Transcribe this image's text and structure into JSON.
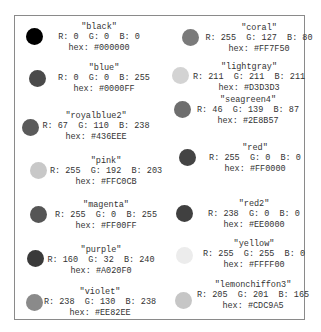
{
  "colors": [
    {
      "name": "\"black\"",
      "rgb": "R: 0  G: 0  B: 0",
      "hex": "hex: #000000",
      "swatch": "#000000",
      "display_gray": "#000000",
      "cx": 34,
      "cy": 36,
      "tx": 99,
      "ty": 22
    },
    {
      "name": "\"blue\"",
      "rgb": "R: 0  G: 0  B: 255",
      "hex": "hex: #0000FF",
      "swatch": "#0000FF",
      "display_gray": "#4a4a4a",
      "cx": 37,
      "cy": 78,
      "tx": 104,
      "ty": 63
    },
    {
      "name": "\"royalblue2\"",
      "rgb": "R: 67  G: 110  B: 238",
      "hex": "hex: #436EEE",
      "swatch": "#436EEE",
      "display_gray": "#5a5a5a",
      "cx": 30,
      "cy": 127,
      "tx": 96,
      "ty": 111
    },
    {
      "name": "\"pink\"",
      "rgb": "R: 255  G: 192  B: 203",
      "hex": "hex: #FFC0CB",
      "swatch": "#FFC0CB",
      "display_gray": "#c8c8c8",
      "cx": 38,
      "cy": 170,
      "tx": 106,
      "ty": 156
    },
    {
      "name": "\"magenta\"",
      "rgb": "R: 255  G: 0  B: 255",
      "hex": "hex: #FF00FF",
      "swatch": "#FF00FF",
      "display_gray": "#555555",
      "cx": 38,
      "cy": 214,
      "tx": 106,
      "ty": 200
    },
    {
      "name": "\"purple\"",
      "rgb": "R: 160  G: 32  B: 240",
      "hex": "hex: #A020F0",
      "swatch": "#A020F0",
      "display_gray": "#3a3a3a",
      "cx": 35,
      "cy": 258,
      "tx": 101,
      "ty": 245
    },
    {
      "name": "\"violet\"",
      "rgb": "R: 238  G: 130  B: 238",
      "hex": "hex: #EE82EE",
      "swatch": "#EE82EE",
      "display_gray": "#8a8a8a",
      "cx": 34,
      "cy": 302,
      "tx": 100,
      "ty": 287
    },
    {
      "name": "\"coral\"",
      "rgb": "R: 255  G: 127  B: 80",
      "hex": "hex: #FF7F50",
      "swatch": "#FF7F50",
      "display_gray": "#7a7a7a",
      "cx": 190,
      "cy": 37,
      "tx": 259,
      "ty": 23
    },
    {
      "name": "\"lightgray\"",
      "rgb": "R: 211  G: 211  B: 211",
      "hex": "hex: #D3D3D3",
      "swatch": "#D3D3D3",
      "display_gray": "#d3d3d3",
      "cx": 180,
      "cy": 75,
      "tx": 249,
      "ty": 62
    },
    {
      "name": "\"seagreen4\"",
      "rgb": "R: 46  G: 139  B: 87",
      "hex": "hex: #2E8B57",
      "swatch": "#2E8B57",
      "display_gray": "#6e6e6e",
      "cx": 182,
      "cy": 109,
      "tx": 248,
      "ty": 95
    },
    {
      "name": "\"red\"",
      "rgb": "R: 255  G: 0  B: 0",
      "hex": "hex: #FF0000",
      "swatch": "#FF0000",
      "display_gray": "#444444",
      "cx": 187,
      "cy": 157,
      "tx": 255,
      "ty": 143
    },
    {
      "name": "\"red2\"",
      "rgb": "R: 238  G: 0  B: 0",
      "hex": "hex: #EE0000",
      "swatch": "#EE0000",
      "display_gray": "#404040",
      "cx": 184,
      "cy": 213,
      "tx": 254,
      "ty": 199
    },
    {
      "name": "\"yellow\"",
      "rgb": "R: 255  G: 255  B: 0",
      "hex": "hex: #FFFF00",
      "swatch": "#FFFF00",
      "display_gray": "#ececec",
      "cx": 184,
      "cy": 255,
      "tx": 254,
      "ty": 239
    },
    {
      "name": "\"lemonchiffon3\"",
      "rgb": "R: 205  G: 201  B: 165",
      "hex": "hex: #CDC9A5",
      "swatch": "#CDC9A5",
      "display_gray": "#c6c6c6",
      "cx": 183,
      "cy": 300,
      "tx": 253,
      "ty": 280
    }
  ]
}
